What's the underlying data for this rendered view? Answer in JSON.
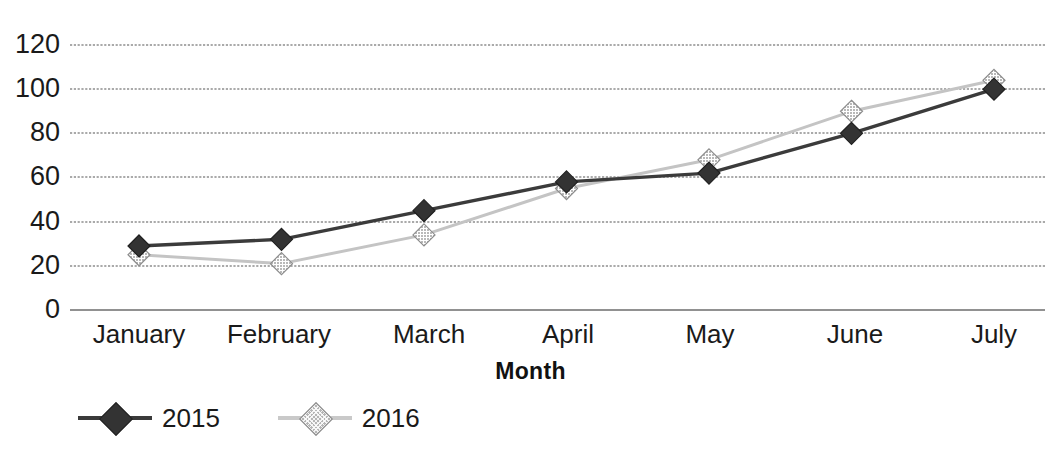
{
  "chart_data": {
    "type": "line",
    "title": "",
    "xlabel": "Month",
    "ylabel": "",
    "categories": [
      "January",
      "February",
      "March",
      "April",
      "May",
      "June",
      "July"
    ],
    "series": [
      {
        "name": "2015",
        "color": "#3b3b3b",
        "marker": "diamond",
        "values": [
          29,
          32,
          45,
          58,
          62,
          80,
          100
        ]
      },
      {
        "name": "2016",
        "color": "#c4c4c4",
        "marker": "diamond-hatched",
        "values": [
          25,
          21,
          34,
          55,
          68,
          90,
          104
        ]
      }
    ],
    "yticks": [
      0,
      20,
      40,
      60,
      80,
      100,
      120
    ],
    "ylim": [
      0,
      120
    ],
    "grid": true,
    "grid_style": "dotted-horizontal",
    "legend_position": "bottom-left"
  },
  "axis": {
    "y_tick_labels": [
      "120",
      "100",
      "80",
      "60",
      "40",
      "20",
      "0"
    ],
    "x_tick_labels": [
      "January",
      "February",
      "March",
      "April",
      "May",
      "June",
      "July"
    ],
    "x_title": "Month"
  },
  "legend": {
    "items": [
      {
        "label": "2015"
      },
      {
        "label": "2016"
      }
    ]
  }
}
